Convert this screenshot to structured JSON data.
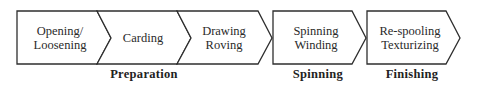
{
  "diagram": {
    "type": "process-flow",
    "steps": [
      {
        "label": "Opening/\nLoosening",
        "group": "Preparation"
      },
      {
        "label": "Carding",
        "group": "Preparation"
      },
      {
        "label": "Drawing\nRoving",
        "group": "Preparation"
      },
      {
        "label": "Spinning\nWinding",
        "group": "Spinning"
      },
      {
        "label": "Re-spooling\nTexturizing",
        "group": "Finishing"
      }
    ],
    "groups": [
      {
        "label": "Preparation"
      },
      {
        "label": "Spinning"
      },
      {
        "label": "Finishing"
      }
    ],
    "colors": {
      "stroke": "#2e2e2e",
      "text": "#2a2a2a",
      "background": "#ffffff"
    }
  }
}
